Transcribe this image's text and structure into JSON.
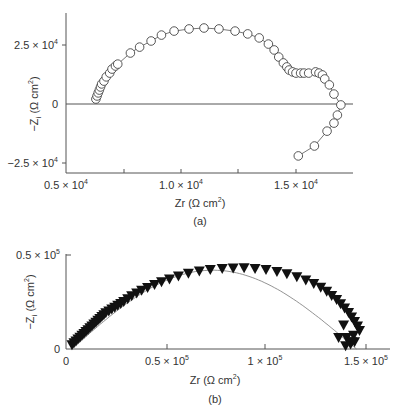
{
  "chart_data": [
    {
      "panel": "(a)",
      "type": "scatter",
      "marker": "open-circle",
      "connected": true,
      "title": "",
      "xlabel": "Zr (Ω cm²)",
      "ylabel": "−Zi (Ω cm²)",
      "xlim": [
        5000,
        17500
      ],
      "ylim": [
        -28000,
        40000
      ],
      "xticks": [
        5000,
        7500,
        10000,
        12500,
        15000
      ],
      "xtick_labels": [
        "0.5 × 10⁴",
        "",
        "1.0 × 10⁴",
        "",
        "1.5 × 10⁴"
      ],
      "yticks": [
        25000,
        0,
        -25000
      ],
      "ytick_labels": [
        "2.5 × 10⁴",
        "0",
        "−2.5 × 10⁴"
      ],
      "zero_line": true,
      "grid": false,
      "x": [
        6300,
        6350,
        6400,
        6450,
        6500,
        6550,
        6650,
        6750,
        6900,
        7000,
        7150,
        7250,
        7800,
        8200,
        8700,
        9150,
        9700,
        10350,
        11000,
        11650,
        12350,
        12900,
        13400,
        13800,
        14050,
        14250,
        14450,
        14600,
        14700,
        14850,
        15000,
        15200,
        15350,
        15550,
        15850,
        16000,
        16150,
        16250,
        16450,
        16650,
        16950,
        16800,
        16650,
        16350,
        15800,
        15100
      ],
      "y": [
        2100,
        3400,
        4700,
        5900,
        7200,
        8500,
        9700,
        11500,
        13100,
        14800,
        16100,
        16900,
        21600,
        24100,
        26700,
        29200,
        30900,
        31800,
        32200,
        31800,
        30900,
        29700,
        28000,
        25400,
        22900,
        19900,
        17400,
        15700,
        14400,
        13600,
        13100,
        13100,
        13100,
        13100,
        13600,
        13100,
        12300,
        10600,
        8100,
        4200,
        -400,
        -4700,
        -8100,
        -11500,
        -17800,
        -22000
      ]
    },
    {
      "panel": "(b)",
      "type": "scatter",
      "marker": "filled-down-triangle",
      "fit_line": "semicircle",
      "title": "",
      "xlabel": "Zr (Ω cm²)",
      "ylabel": "−Zi (Ω cm²)",
      "xlim": [
        0,
        160000
      ],
      "ylim": [
        0,
        52000
      ],
      "xticks": [
        0,
        50000,
        100000,
        150000
      ],
      "xtick_labels": [
        "0",
        "0.5 × 10⁵",
        "1 × 10⁵",
        "1.5 × 10⁵"
      ],
      "yticks": [
        0,
        50000
      ],
      "ytick_labels": [
        "0",
        "0.5 × 10⁵"
      ],
      "grid": false,
      "x": [
        3000,
        4000,
        5000,
        6000,
        7000,
        8000,
        9000,
        10000,
        11000,
        12000,
        13000,
        14000,
        15000,
        16000,
        17000,
        18000,
        19000,
        20000,
        21500,
        23000,
        24500,
        26000,
        27500,
        29000,
        31000,
        33000,
        35500,
        38000,
        41000,
        44500,
        48000,
        52000,
        56500,
        61500,
        67000,
        72500,
        78500,
        84000,
        89500,
        95000,
        100500,
        106000,
        111000,
        116000,
        120500,
        124500,
        128000,
        131000,
        133500,
        136000,
        138000,
        140000,
        142000,
        143500,
        145000,
        146500,
        147500,
        144500,
        139500,
        137000,
        141000,
        143500,
        145000,
        143000,
        140500
      ],
      "y": [
        2000,
        3000,
        4000,
        5000,
        6000,
        7000,
        8000,
        9000,
        10000,
        11000,
        12000,
        13000,
        14000,
        15000,
        16000,
        17000,
        18000,
        19000,
        20000,
        21000,
        22000,
        23000,
        24000,
        25000,
        26500,
        28000,
        29500,
        31000,
        32500,
        34000,
        35500,
        37000,
        38500,
        40000,
        41200,
        42000,
        42500,
        42800,
        42900,
        42600,
        42000,
        41000,
        39800,
        38200,
        36500,
        34600,
        32600,
        30400,
        28200,
        26000,
        23800,
        21500,
        19200,
        16800,
        14400,
        12000,
        9600,
        7000,
        12500,
        5800,
        5800,
        3600,
        3600,
        2400,
        1500
      ]
    }
  ],
  "panels": {
    "a": {
      "label": "(a)",
      "xlabel": "Zr (Ω cm",
      "ylabel": "−Z",
      "ylabel_sub": "i",
      "ylabel_rest": " (Ω cm",
      "yticks": [
        "2.5 × 10",
        "0",
        "−2.5 × 10"
      ],
      "ytick_exp": "4",
      "xticks": [
        "0.5 × 10",
        "1.0 × 10",
        "1.5 × 10"
      ],
      "xtick_exp": "4"
    },
    "b": {
      "label": "(b)",
      "xlabel": "Zr (Ω cm",
      "ylabel": "−Z",
      "ylabel_sub": "i",
      "ylabel_rest": " (Ω cm",
      "yticks": [
        "0.5 × 10",
        "0"
      ],
      "ytick_exp": "5",
      "xticks": [
        "0",
        "0.5 × 10",
        "1 × 10",
        "1.5 × 10"
      ],
      "xtick_exp": "5"
    },
    "superscript_2": "2",
    "close_paren": ")"
  }
}
